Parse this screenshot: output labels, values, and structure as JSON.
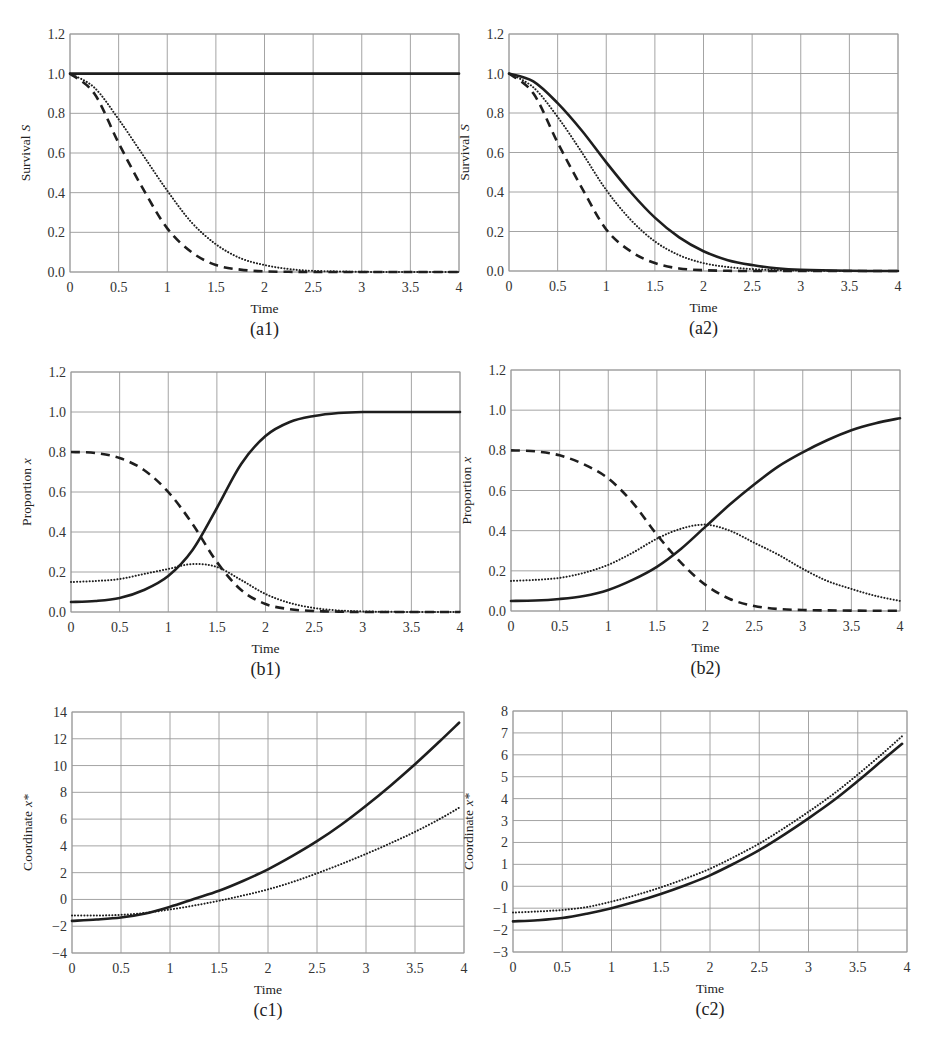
{
  "chart_data": [
    {
      "id": "a1",
      "type": "line",
      "caption": "(a1)",
      "xlabel": "Time",
      "ylabel": "Survival",
      "ylabel_var": "S",
      "xlim": [
        0,
        4
      ],
      "ylim": [
        0,
        1.2
      ],
      "xticks": [
        "0",
        "0.5",
        "1",
        "1.5",
        "2",
        "2.5",
        "3",
        "3.5",
        "4"
      ],
      "yticks": [
        "0.0",
        "0.2",
        "0.4",
        "0.6",
        "0.8",
        "1.0",
        "1.2"
      ],
      "grid": true,
      "x": [
        0,
        0.25,
        0.5,
        0.75,
        1,
        1.25,
        1.5,
        1.75,
        2,
        2.25,
        2.5,
        3,
        3.5,
        4
      ],
      "series": [
        {
          "name": "solid",
          "style": "solid",
          "values": [
            1,
            1,
            1,
            1,
            1,
            1,
            1,
            1,
            1,
            1,
            1,
            1,
            1,
            1
          ]
        },
        {
          "name": "dotted",
          "style": "dotted",
          "values": [
            1,
            0.93,
            0.77,
            0.59,
            0.41,
            0.25,
            0.14,
            0.07,
            0.035,
            0.015,
            0.006,
            0.001,
            0,
            0
          ]
        },
        {
          "name": "dashed",
          "style": "dashed",
          "values": [
            1,
            0.9,
            0.65,
            0.42,
            0.22,
            0.1,
            0.035,
            0.012,
            0.003,
            0.001,
            0,
            0,
            0,
            0
          ]
        }
      ]
    },
    {
      "id": "a2",
      "type": "line",
      "caption": "(a2)",
      "xlabel": "Time",
      "ylabel": "Survival",
      "ylabel_var": "S",
      "xlim": [
        0,
        4
      ],
      "ylim": [
        0,
        1.2
      ],
      "xticks": [
        "0",
        "0.5",
        "1",
        "1.5",
        "2",
        "2.5",
        "3",
        "3.5",
        "4"
      ],
      "yticks": [
        "0.0",
        "0.2",
        "0.4",
        "0.6",
        "0.8",
        "1.0",
        "1.2"
      ],
      "grid": true,
      "x": [
        0,
        0.25,
        0.5,
        0.75,
        1,
        1.25,
        1.5,
        1.75,
        2,
        2.25,
        2.5,
        2.75,
        3,
        3.5,
        4
      ],
      "series": [
        {
          "name": "solid",
          "style": "solid",
          "values": [
            1,
            0.96,
            0.85,
            0.71,
            0.55,
            0.4,
            0.27,
            0.17,
            0.1,
            0.055,
            0.03,
            0.014,
            0.006,
            0.001,
            0
          ]
        },
        {
          "name": "dotted",
          "style": "dotted",
          "values": [
            1,
            0.93,
            0.78,
            0.6,
            0.41,
            0.26,
            0.15,
            0.08,
            0.04,
            0.02,
            0.01,
            0.005,
            0.002,
            0,
            0
          ]
        },
        {
          "name": "dashed",
          "style": "dashed",
          "values": [
            1,
            0.9,
            0.65,
            0.42,
            0.21,
            0.1,
            0.04,
            0.013,
            0.004,
            0.001,
            0,
            0,
            0,
            0,
            0
          ]
        }
      ]
    },
    {
      "id": "b1",
      "type": "line",
      "caption": "(b1)",
      "xlabel": "Time",
      "ylabel": "Proportion",
      "ylabel_var": "x",
      "xlim": [
        0,
        4
      ],
      "ylim": [
        0,
        1.2
      ],
      "xticks": [
        "0",
        "0.5",
        "1",
        "1.5",
        "2",
        "2.5",
        "3",
        "3.5",
        "4"
      ],
      "yticks": [
        "0.0",
        "0.2",
        "0.4",
        "0.6",
        "0.8",
        "1.0",
        "1.2"
      ],
      "grid": true,
      "x": [
        0,
        0.25,
        0.5,
        0.75,
        1,
        1.25,
        1.5,
        1.75,
        2,
        2.25,
        2.5,
        2.75,
        3,
        3.5,
        4
      ],
      "series": [
        {
          "name": "solid",
          "style": "solid",
          "values": [
            0.05,
            0.055,
            0.07,
            0.11,
            0.18,
            0.31,
            0.52,
            0.74,
            0.88,
            0.95,
            0.98,
            0.995,
            1,
            1,
            1
          ]
        },
        {
          "name": "dotted",
          "style": "dotted",
          "values": [
            0.15,
            0.155,
            0.165,
            0.19,
            0.215,
            0.24,
            0.225,
            0.16,
            0.09,
            0.045,
            0.02,
            0.008,
            0.003,
            0,
            0
          ]
        },
        {
          "name": "dashed",
          "style": "dashed",
          "values": [
            0.8,
            0.795,
            0.77,
            0.71,
            0.6,
            0.44,
            0.25,
            0.11,
            0.04,
            0.014,
            0.005,
            0.002,
            0,
            0,
            0
          ]
        }
      ]
    },
    {
      "id": "b2",
      "type": "line",
      "caption": "(b2)",
      "xlabel": "Time",
      "ylabel": "Proportion",
      "ylabel_var": "x",
      "xlim": [
        0,
        4
      ],
      "ylim": [
        0,
        1.2
      ],
      "xticks": [
        "0",
        "0.5",
        "1",
        "1.5",
        "2",
        "2.5",
        "3",
        "3.5",
        "4"
      ],
      "yticks": [
        "0.0",
        "0.2",
        "0.4",
        "0.6",
        "0.8",
        "1.0",
        "1.2"
      ],
      "grid": true,
      "x": [
        0,
        0.25,
        0.5,
        0.75,
        1,
        1.25,
        1.5,
        1.75,
        2,
        2.25,
        2.5,
        2.75,
        3,
        3.25,
        3.5,
        3.75,
        4
      ],
      "series": [
        {
          "name": "solid",
          "style": "solid",
          "values": [
            0.05,
            0.052,
            0.06,
            0.075,
            0.105,
            0.155,
            0.22,
            0.31,
            0.42,
            0.53,
            0.63,
            0.72,
            0.79,
            0.85,
            0.9,
            0.935,
            0.96
          ]
        },
        {
          "name": "dotted",
          "style": "dotted",
          "values": [
            0.15,
            0.155,
            0.165,
            0.19,
            0.23,
            0.29,
            0.36,
            0.41,
            0.43,
            0.4,
            0.34,
            0.28,
            0.21,
            0.15,
            0.11,
            0.075,
            0.05
          ]
        },
        {
          "name": "dashed",
          "style": "dashed",
          "values": [
            0.8,
            0.795,
            0.775,
            0.73,
            0.66,
            0.54,
            0.38,
            0.24,
            0.13,
            0.06,
            0.025,
            0.01,
            0.005,
            0.003,
            0.002,
            0.001,
            0.001
          ]
        }
      ]
    },
    {
      "id": "c1",
      "type": "line",
      "caption": "(c1)",
      "xlabel": "Time",
      "ylabel": "Coordinate",
      "ylabel_var": "x*",
      "xlim": [
        0,
        4
      ],
      "ylim": [
        -4,
        14
      ],
      "xticks": [
        "0",
        "0.5",
        "1",
        "1.5",
        "2",
        "2.5",
        "3",
        "3.5",
        "4"
      ],
      "yticks": [
        "−4",
        "−2",
        "0",
        "2",
        "4",
        "6",
        "8",
        "10",
        "12",
        "14"
      ],
      "grid": true,
      "x": [
        0,
        0.25,
        0.5,
        0.75,
        1,
        1.25,
        1.5,
        1.75,
        2,
        2.25,
        2.5,
        2.75,
        3,
        3.25,
        3.5,
        3.75,
        3.95
      ],
      "series": [
        {
          "name": "solid",
          "style": "solid",
          "values": [
            -1.6,
            -1.5,
            -1.35,
            -1.05,
            -0.55,
            0.05,
            0.65,
            1.4,
            2.25,
            3.25,
            4.35,
            5.6,
            7.0,
            8.5,
            10.1,
            11.8,
            13.2
          ]
        },
        {
          "name": "dotted",
          "style": "dotted",
          "values": [
            -1.2,
            -1.2,
            -1.15,
            -1.0,
            -0.75,
            -0.45,
            -0.1,
            0.3,
            0.75,
            1.3,
            1.95,
            2.65,
            3.4,
            4.2,
            5.05,
            6.0,
            6.85
          ]
        }
      ]
    },
    {
      "id": "c2",
      "type": "line",
      "caption": "(c2)",
      "xlabel": "Time",
      "ylabel": "Coordinate",
      "ylabel_var": "x*",
      "xlim": [
        0,
        4
      ],
      "ylim": [
        -3,
        8
      ],
      "xticks": [
        "0",
        "0.5",
        "1",
        "1.5",
        "2",
        "2.5",
        "3",
        "3.5",
        "4"
      ],
      "yticks": [
        "−3",
        "−2",
        "−1",
        "0",
        "1",
        "2",
        "3",
        "4",
        "5",
        "6",
        "7",
        "8"
      ],
      "grid": true,
      "x": [
        0,
        0.25,
        0.5,
        0.75,
        1,
        1.25,
        1.5,
        1.75,
        2,
        2.25,
        2.5,
        2.75,
        3,
        3.25,
        3.5,
        3.75,
        3.95
      ],
      "series": [
        {
          "name": "solid",
          "style": "solid",
          "values": [
            -1.6,
            -1.55,
            -1.45,
            -1.25,
            -1.0,
            -0.7,
            -0.35,
            0.05,
            0.5,
            1.05,
            1.65,
            2.35,
            3.1,
            3.9,
            4.8,
            5.75,
            6.5
          ]
        },
        {
          "name": "dotted",
          "style": "dotted",
          "values": [
            -1.2,
            -1.15,
            -1.08,
            -0.95,
            -0.7,
            -0.4,
            -0.05,
            0.35,
            0.8,
            1.35,
            1.95,
            2.65,
            3.4,
            4.2,
            5.1,
            6.05,
            6.85
          ]
        }
      ]
    }
  ]
}
